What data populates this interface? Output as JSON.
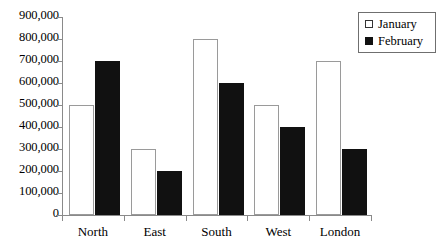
{
  "chart_data": {
    "type": "bar",
    "title": "",
    "xlabel": "",
    "ylabel": "",
    "categories": [
      "North",
      "East",
      "South",
      "West",
      "London"
    ],
    "series": [
      {
        "name": "January",
        "values": [
          500000,
          300000,
          800000,
          500000,
          700000
        ]
      },
      {
        "name": "February",
        "values": [
          700000,
          200000,
          600000,
          400000,
          300000
        ]
      }
    ],
    "ylim": [
      0,
      900000
    ],
    "ytick_values": [
      900000,
      800000,
      700000,
      600000,
      500000,
      400000,
      300000,
      200000,
      100000,
      0
    ],
    "ytick_labels": [
      "900,000",
      "800,000",
      "700,000",
      "600,000",
      "500,000",
      "400,000",
      "300,000",
      "200,000",
      "100,000",
      "0"
    ],
    "grid": false,
    "legend_position": "top-right",
    "colors": {
      "january_fill": "#ffffff",
      "january_border": "#9a9a9a",
      "february_fill": "#111111",
      "axis": "#8a8a8a",
      "text": "#000000",
      "background": "#ffffff"
    }
  },
  "legend": {
    "entries": [
      {
        "label": "January",
        "swatch": "open-square-icon"
      },
      {
        "label": "February",
        "swatch": "filled-square-icon"
      }
    ]
  }
}
